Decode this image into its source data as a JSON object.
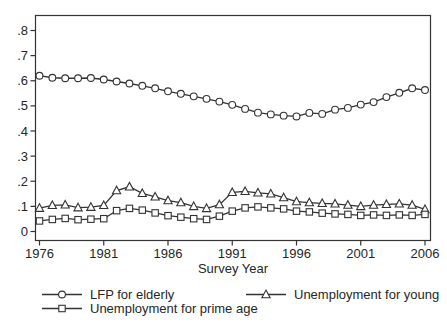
{
  "figure": {
    "background": "#ffffff",
    "ink_color": "#333333",
    "marker_fill": "#ffffff"
  },
  "chart_data": {
    "type": "line",
    "title": "",
    "xlabel": "Survey Year",
    "ylabel": "",
    "grid": "off",
    "legend_position": "bottom",
    "ylim": [
      0,
      0.8
    ],
    "xlim": [
      1976,
      2006
    ],
    "xticks": [
      1976,
      1981,
      1986,
      1991,
      1996,
      2001,
      2006
    ],
    "yticks": [
      0,
      0.1,
      0.2,
      0.3,
      0.4,
      0.5,
      0.6,
      0.7,
      0.8
    ],
    "ytick_labels": [
      "0",
      ".1",
      ".2",
      ".3",
      ".4",
      ".5",
      ".6",
      ".7",
      ".8"
    ],
    "x": [
      1976,
      1977,
      1978,
      1979,
      1980,
      1981,
      1982,
      1983,
      1984,
      1985,
      1986,
      1987,
      1988,
      1989,
      1990,
      1991,
      1992,
      1993,
      1994,
      1995,
      1996,
      1997,
      1998,
      1999,
      2000,
      2001,
      2002,
      2003,
      2004,
      2005,
      2006
    ],
    "series": [
      {
        "name": "LFP for elderly",
        "marker": "circle",
        "values": [
          0.62,
          0.612,
          0.61,
          0.61,
          0.611,
          0.605,
          0.597,
          0.589,
          0.58,
          0.57,
          0.558,
          0.548,
          0.538,
          0.528,
          0.517,
          0.504,
          0.488,
          0.473,
          0.466,
          0.461,
          0.458,
          0.472,
          0.468,
          0.485,
          0.492,
          0.505,
          0.515,
          0.535,
          0.552,
          0.57,
          0.563
        ]
      },
      {
        "name": "Unemployment for young",
        "marker": "triangle",
        "values": [
          0.093,
          0.104,
          0.106,
          0.095,
          0.097,
          0.104,
          0.163,
          0.178,
          0.152,
          0.138,
          0.123,
          0.115,
          0.1,
          0.092,
          0.107,
          0.156,
          0.16,
          0.154,
          0.15,
          0.135,
          0.119,
          0.115,
          0.112,
          0.11,
          0.105,
          0.1,
          0.105,
          0.108,
          0.11,
          0.105,
          0.088
        ]
      },
      {
        "name": "Unemployment for prime age",
        "marker": "square",
        "values": [
          0.042,
          0.048,
          0.052,
          0.047,
          0.049,
          0.051,
          0.083,
          0.092,
          0.085,
          0.074,
          0.063,
          0.057,
          0.051,
          0.048,
          0.061,
          0.081,
          0.094,
          0.098,
          0.094,
          0.09,
          0.081,
          0.078,
          0.073,
          0.07,
          0.068,
          0.064,
          0.066,
          0.064,
          0.066,
          0.064,
          0.068
        ]
      }
    ]
  }
}
